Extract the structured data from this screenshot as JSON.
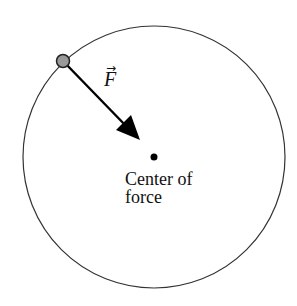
{
  "diagram": {
    "orbit": {
      "cx": 154,
      "cy": 157,
      "r": 131,
      "stroke": "#333333"
    },
    "particle": {
      "cx": 63,
      "cy": 61,
      "r": 6,
      "fill": "#999999"
    },
    "force_vector": {
      "label": "F",
      "accent": "→",
      "x1": 63,
      "y1": 61,
      "x2": 139,
      "y2": 139
    },
    "center": {
      "cx": 154,
      "cy": 157,
      "r": 3.5,
      "label_line1": "Center of",
      "label_line2": "force"
    }
  }
}
